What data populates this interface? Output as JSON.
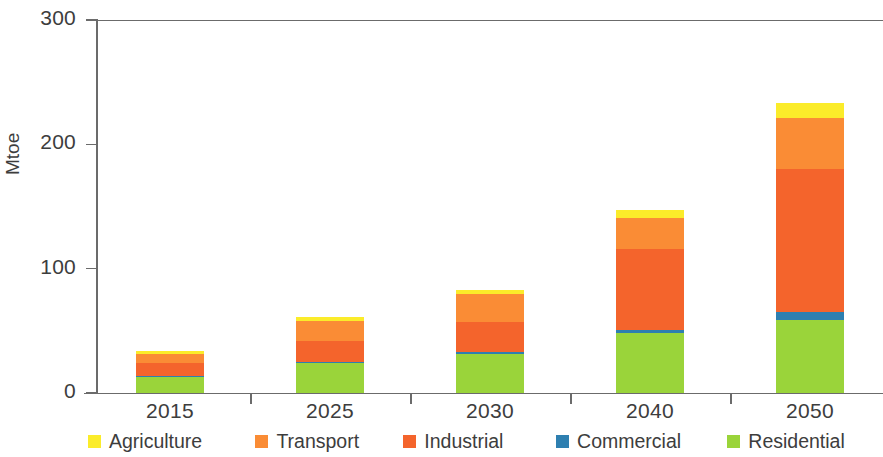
{
  "chart_data": {
    "type": "bar",
    "stacked": true,
    "title": "",
    "xlabel": "",
    "ylabel": "Mtoe",
    "ylim": [
      0,
      300
    ],
    "yticks": [
      0,
      100,
      200,
      300
    ],
    "ytick_labels": [
      "0",
      "100",
      "200",
      "300"
    ],
    "grid": false,
    "legend_position": "bottom",
    "categories": [
      "2015",
      "2025",
      "2030",
      "2040",
      "2050"
    ],
    "series": [
      {
        "name": "Residential",
        "color": "#9ad43a",
        "values": [
          13,
          24,
          31,
          48,
          59
        ]
      },
      {
        "name": "Commercial",
        "color": "#2e7fb0",
        "values": [
          1,
          1,
          2,
          3,
          6
        ]
      },
      {
        "name": "Industrial",
        "color": "#f4642c",
        "values": [
          10,
          17,
          24,
          65,
          115
        ]
      },
      {
        "name": "Transport",
        "color": "#fa8c35",
        "values": [
          7,
          16,
          23,
          25,
          41
        ]
      },
      {
        "name": "Agriculture",
        "color": "#fbec2a",
        "values": [
          3,
          3,
          3,
          6,
          12
        ]
      }
    ],
    "totals": [
      34,
      61,
      83,
      147,
      233
    ],
    "stack_order_bottom_to_top": [
      "Residential",
      "Commercial",
      "Industrial",
      "Transport",
      "Agriculture"
    ]
  },
  "legend": {
    "items": [
      {
        "label": "Agriculture",
        "color": "#fbec2a"
      },
      {
        "label": "Transport",
        "color": "#fa8c35"
      },
      {
        "label": "Industrial",
        "color": "#f4642c"
      },
      {
        "label": "Commercial",
        "color": "#2e7fb0"
      },
      {
        "label": "Residential",
        "color": "#9ad43a"
      }
    ]
  },
  "axis": {
    "y_label": "Mtoe",
    "y_ticks": [
      "300",
      "200",
      "100",
      "0"
    ],
    "x_ticks": [
      "2015",
      "2025",
      "2030",
      "2040",
      "2050"
    ]
  },
  "colors": {
    "axis": "#6b6b6b",
    "text": "#3d3d3d",
    "background": "#ffffff"
  }
}
